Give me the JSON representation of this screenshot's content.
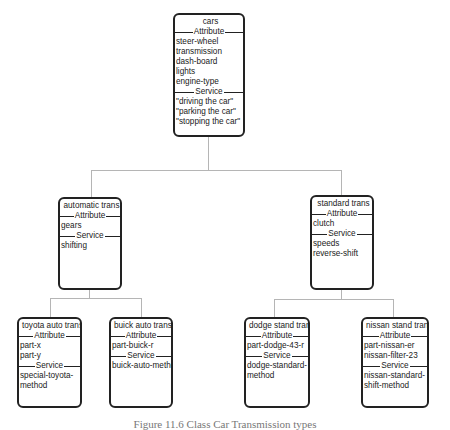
{
  "diagram": {
    "type": "class-hierarchy",
    "section_labels": {
      "attribute": "Attribute",
      "service": "Service"
    },
    "nodes": {
      "cars": {
        "title": "cars",
        "attributes": [
          "steer-wheel",
          "transmission",
          "dash-board",
          "lights",
          "engine-type"
        ],
        "services": [
          "\"driving the car\"",
          "\"parking the car\"",
          "\"stopping the car\""
        ]
      },
      "automatic": {
        "title": "automatic trans",
        "attributes": [
          "gears"
        ],
        "services": [
          "shifting"
        ]
      },
      "standard": {
        "title": "standard trans",
        "attributes": [
          "clutch"
        ],
        "services": [
          "speeds",
          "reverse-shift"
        ]
      },
      "toyota": {
        "title": "toyota auto trans",
        "attributes": [
          "part-x",
          "part-y"
        ],
        "services": [
          "special-toyota-",
          "method"
        ]
      },
      "buick": {
        "title": "buick auto trans",
        "attributes": [
          "part-buick-r"
        ],
        "services": [
          "buick-auto-method"
        ]
      },
      "dodge": {
        "title": "dodge stand trans",
        "attributes": [
          "part-dodge-43-r"
        ],
        "services": [
          "dodge-standard-",
          "method"
        ]
      },
      "nissan": {
        "title": "nissan stand tran",
        "attributes": [
          "part-nissan-er",
          "nissan-filter-23"
        ],
        "services": [
          "nissan-standard-",
          "shift-method"
        ]
      }
    },
    "edges": [
      [
        "cars",
        "automatic"
      ],
      [
        "cars",
        "standard"
      ],
      [
        "automatic",
        "toyota"
      ],
      [
        "automatic",
        "buick"
      ],
      [
        "standard",
        "dodge"
      ],
      [
        "standard",
        "nissan"
      ]
    ],
    "caption": "Figure 11.6 Class Car Transmission types"
  }
}
